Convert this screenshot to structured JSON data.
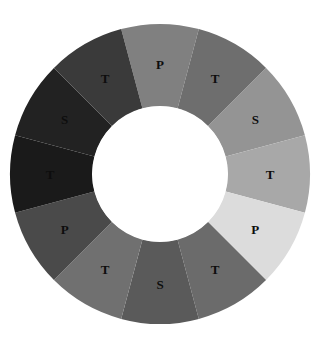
{
  "figure": {
    "background_color": "#ffffff",
    "hole_color": "#ffffff",
    "label_color": "#0d0d0d"
  },
  "chart_data": {
    "type": "pie",
    "variant": "donut",
    "title": "",
    "subtitle": "",
    "xlabel": "",
    "ylabel": "",
    "legend": "none",
    "grid": false,
    "center_x": 160,
    "center_y": 174,
    "outer_radius": 150,
    "inner_radius": 68,
    "label_radius": 110,
    "segment_count": 12,
    "segment_angle_deg": 30,
    "start_angle_deg": -15,
    "categories": [
      "P",
      "T",
      "S",
      "T",
      "P",
      "T",
      "S",
      "T",
      "P",
      "T",
      "S",
      "T"
    ],
    "values": [
      1,
      1,
      1,
      1,
      1,
      1,
      1,
      1,
      1,
      1,
      1,
      1
    ],
    "colors": [
      "#808080",
      "#6e6e6e",
      "#949494",
      "#a8a8a8",
      "#dcdcdc",
      "#6b6b6b",
      "#5a5a5a",
      "#707070",
      "#4a4a4a",
      "#1a1a1a",
      "#222222",
      "#3a3a3a"
    ],
    "segments": [
      {
        "index": 0,
        "label": "P",
        "color": "#808080",
        "start_deg": -15,
        "end_deg": 15,
        "mid_deg": 0,
        "position": "top"
      },
      {
        "index": 1,
        "label": "T",
        "color": "#6e6e6e",
        "start_deg": 15,
        "end_deg": 45,
        "mid_deg": 30,
        "position": "upper-right"
      },
      {
        "index": 2,
        "label": "S",
        "color": "#949494",
        "start_deg": 45,
        "end_deg": 75,
        "mid_deg": 60,
        "position": "right-upper"
      },
      {
        "index": 3,
        "label": "T",
        "color": "#a8a8a8",
        "start_deg": 75,
        "end_deg": 105,
        "mid_deg": 90,
        "position": "right"
      },
      {
        "index": 4,
        "label": "P",
        "color": "#dcdcdc",
        "start_deg": 105,
        "end_deg": 135,
        "mid_deg": 120,
        "position": "right-lower"
      },
      {
        "index": 5,
        "label": "T",
        "color": "#6b6b6b",
        "start_deg": 135,
        "end_deg": 165,
        "mid_deg": 150,
        "position": "lower-right"
      },
      {
        "index": 6,
        "label": "S",
        "color": "#5a5a5a",
        "start_deg": 165,
        "end_deg": 195,
        "mid_deg": 180,
        "position": "bottom"
      },
      {
        "index": 7,
        "label": "T",
        "color": "#707070",
        "start_deg": 195,
        "end_deg": 225,
        "mid_deg": 210,
        "position": "lower-left"
      },
      {
        "index": 8,
        "label": "P",
        "color": "#4a4a4a",
        "start_deg": 225,
        "end_deg": 255,
        "mid_deg": 240,
        "position": "left-lower"
      },
      {
        "index": 9,
        "label": "T",
        "color": "#1a1a1a",
        "start_deg": 255,
        "end_deg": 285,
        "mid_deg": 270,
        "position": "left"
      },
      {
        "index": 10,
        "label": "S",
        "color": "#222222",
        "start_deg": 285,
        "end_deg": 315,
        "mid_deg": 300,
        "position": "left-upper"
      },
      {
        "index": 11,
        "label": "T",
        "color": "#3a3a3a",
        "start_deg": 315,
        "end_deg": 345,
        "mid_deg": 330,
        "position": "upper-left"
      }
    ]
  }
}
